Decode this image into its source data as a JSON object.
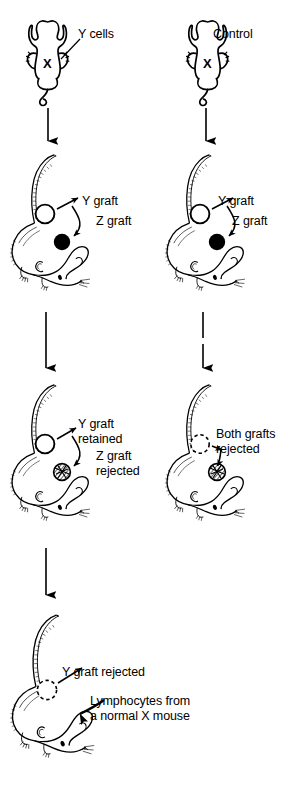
{
  "figure": {
    "width": 296,
    "height": 787,
    "background_color": "#ffffff",
    "ink_color": "#000000"
  },
  "columns": [
    {
      "id": "experimental",
      "label": "Y cells"
    },
    {
      "id": "control",
      "label": "Control"
    }
  ],
  "rows": [
    {
      "id": "row1-injection",
      "mice": [
        {
          "id": "mouse-experimental-top",
          "view": "dorsal",
          "strain_mark": "X",
          "labels": [
            {
              "id": "y-cells-label",
              "text": "Y cells",
              "x": 78,
              "y": 27
            }
          ]
        },
        {
          "id": "mouse-control-top",
          "view": "dorsal",
          "strain_mark": "X",
          "labels": [
            {
              "id": "control-label",
              "text": "Control",
              "x": 213,
              "y": 27
            }
          ]
        }
      ]
    },
    {
      "id": "row2-grafted",
      "mice": [
        {
          "id": "mouse-experimental-grafted",
          "view": "lateral",
          "grafts": [
            {
              "id": "y-graft-open",
              "type": "Y",
              "state": "open"
            },
            {
              "id": "z-graft-filled",
              "type": "Z",
              "state": "filled"
            }
          ],
          "labels": [
            {
              "id": "y-graft-label",
              "text": "Y graft",
              "x": 82,
              "y": 194
            },
            {
              "id": "z-graft-label",
              "text": "Z graft",
              "x": 96,
              "y": 214
            }
          ]
        },
        {
          "id": "mouse-control-grafted",
          "view": "lateral",
          "grafts": [
            {
              "id": "y-graft-open",
              "type": "Y",
              "state": "open"
            },
            {
              "id": "z-graft-filled",
              "type": "Z",
              "state": "filled"
            }
          ],
          "labels": [
            {
              "id": "y-graft-label",
              "text": "Y graft",
              "x": 218,
              "y": 194
            },
            {
              "id": "z-graft-label",
              "text": "Z graft",
              "x": 232,
              "y": 214
            }
          ]
        }
      ]
    },
    {
      "id": "row3-outcome",
      "mice": [
        {
          "id": "mouse-experimental-outcome",
          "view": "lateral",
          "grafts": [
            {
              "id": "y-graft-retained",
              "type": "Y",
              "state": "open"
            },
            {
              "id": "z-graft-rejected",
              "type": "Z",
              "state": "hatched"
            }
          ],
          "labels": [
            {
              "id": "y-graft-retained-label",
              "text": "Y graft\nretained",
              "x": 78,
              "y": 417
            },
            {
              "id": "z-graft-rejected-label",
              "text": "Z graft\nrejected",
              "x": 96,
              "y": 449
            }
          ]
        },
        {
          "id": "mouse-control-outcome",
          "view": "lateral",
          "grafts": [
            {
              "id": "y-graft-rejected",
              "type": "Y",
              "state": "dashed"
            },
            {
              "id": "z-graft-rejected",
              "type": "Z",
              "state": "hatched"
            }
          ],
          "labels": [
            {
              "id": "both-grafts-rejected-label",
              "text": "Both grafts\nrejected",
              "x": 216,
              "y": 427
            }
          ]
        }
      ]
    },
    {
      "id": "row4-lymphocyte-transfer",
      "mice": [
        {
          "id": "mouse-lymphocyte-transfer",
          "view": "lateral",
          "grafts": [
            {
              "id": "y-graft-rejected",
              "type": "Y",
              "state": "dashed"
            }
          ],
          "labels": [
            {
              "id": "y-graft-rejected-label",
              "text": "Y graft rejected",
              "x": 62,
              "y": 665
            },
            {
              "id": "lymphocytes-label",
              "text": "Lymphocytes from\na normal X mouse",
              "x": 90,
              "y": 694
            }
          ]
        }
      ]
    }
  ],
  "flow_arrows": [
    {
      "id": "arrow-left-1",
      "from": "mouse-experimental-top",
      "to": "mouse-experimental-grafted",
      "style": "solid"
    },
    {
      "id": "arrow-right-1",
      "from": "mouse-control-top",
      "to": "mouse-control-grafted",
      "style": "solid"
    },
    {
      "id": "arrow-left-2",
      "from": "mouse-experimental-grafted",
      "to": "mouse-experimental-outcome",
      "style": "solid"
    },
    {
      "id": "arrow-right-2",
      "from": "mouse-control-grafted",
      "to": "mouse-control-outcome",
      "style": "broken"
    },
    {
      "id": "arrow-left-3",
      "from": "mouse-experimental-outcome",
      "to": "mouse-lymphocyte-transfer",
      "style": "solid"
    }
  ]
}
